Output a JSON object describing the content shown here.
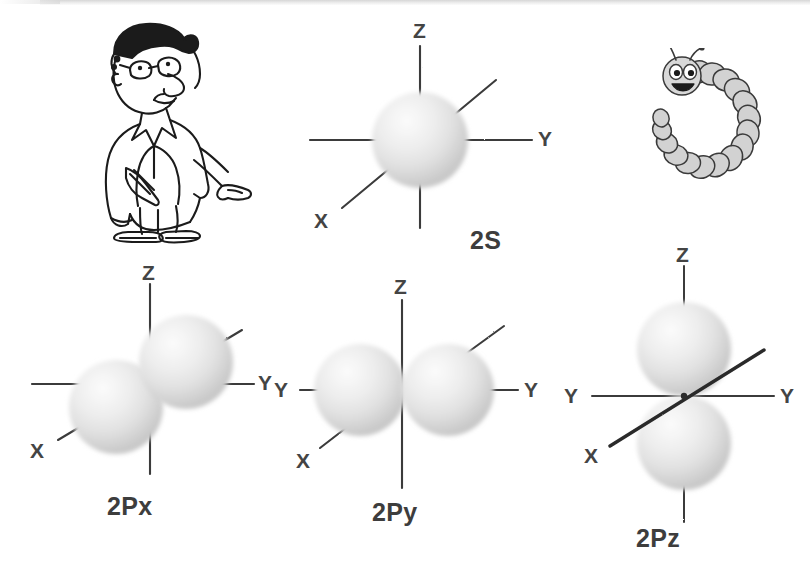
{
  "figure": {
    "background_color": "#ffffff",
    "sphere_color_light": "#f2f2f2",
    "sphere_color_mid": "#dcdcdc",
    "sphere_color_dark": "#b9b9b9",
    "axis_color": "#3a3a3a",
    "label_color": "#3d3d3d"
  },
  "illustrations": {
    "scientist": {
      "name": "cartoon-scientist",
      "description": "Cartoon man in lab coat with glasses and curly hair pointing to the right"
    },
    "caterpillar": {
      "name": "cartoon-caterpillar",
      "description": "Smiling segmented caterpillar curled into a C shape with two antennae"
    }
  },
  "orbitals": [
    {
      "id": "2s",
      "name": "2S",
      "lobes": 1,
      "axes": [
        {
          "label": "Z",
          "position": "top"
        },
        {
          "label": "Y",
          "position": "right"
        },
        {
          "label": "X",
          "position": "lower-left"
        }
      ]
    },
    {
      "id": "2px",
      "name": "2Px",
      "lobes": 2,
      "axes": [
        {
          "label": "Z",
          "position": "top"
        },
        {
          "label": "Y",
          "position": "right"
        },
        {
          "label": "X",
          "position": "lower-left"
        }
      ]
    },
    {
      "id": "2py",
      "name": "2Py",
      "lobes": 2,
      "axes": [
        {
          "label": "Z",
          "position": "top"
        },
        {
          "label": "Y",
          "position": "left"
        },
        {
          "label": "Y",
          "position": "right"
        },
        {
          "label": "X",
          "position": "lower-left"
        }
      ]
    },
    {
      "id": "2pz",
      "name": "2Pz",
      "lobes": 2,
      "axes": [
        {
          "label": "Z",
          "position": "top"
        },
        {
          "label": "Y",
          "position": "left"
        },
        {
          "label": "Y",
          "position": "right"
        },
        {
          "label": "X",
          "position": "lower-left"
        }
      ]
    }
  ],
  "labels": {
    "s_2s": "2S",
    "s_2px": "2Px",
    "s_2py": "2Py",
    "s_2pz": "2Pz",
    "axis_z": "Z",
    "axis_y": "Y",
    "axis_x": "X"
  },
  "caption": ""
}
